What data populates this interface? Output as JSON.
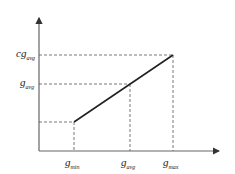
{
  "diagram": {
    "axes": {
      "x_axis": "horizontal arrow",
      "y_axis": "vertical arrow"
    },
    "x_labels": [
      {
        "main": "g",
        "sub": "min"
      },
      {
        "main": "g",
        "sub": "avg"
      },
      {
        "main": "g",
        "sub": "max"
      }
    ],
    "y_labels": [
      {
        "main": "cg",
        "sub": "avg"
      },
      {
        "main": "g",
        "sub": "avg"
      }
    ],
    "line": {
      "from": "(g_min, low)",
      "to": "(g_max, cg_avg)"
    },
    "colors": {
      "axis": "#555555",
      "line": "#222222",
      "dashed": "#555555"
    }
  }
}
